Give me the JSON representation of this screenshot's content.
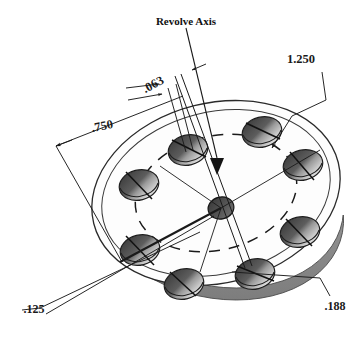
{
  "drawing": {
    "title": "Revolve Axis",
    "part_type": "revolved-disc-with-bolt-circle",
    "background_color": "#ffffff",
    "line_color": "#1a1a1a",
    "edge_band_color": "#8c8c8c",
    "hole_dark_color": "#4a4a4a",
    "hole_mid_color": "#6f6f6f",
    "hole_light_color": "#e8e8e8",
    "face_color": "#fdfdfd",
    "hole_count": 8,
    "annotations": {
      "axis_label": "Revolve Axis",
      "dimensions": [
        {
          "name": "outer-diameter",
          "value": "1.250",
          "x": 300,
          "y": 60
        },
        {
          "name": "hole-diameter",
          "value": ".063",
          "x": 155,
          "y": 88,
          "rotation": -30
        },
        {
          "name": "bolt-circle-offset",
          "value": ".750",
          "x": 100,
          "y": 128,
          "rotation": -12
        },
        {
          "name": "hub-diameter",
          "value": ".125",
          "x": 32,
          "y": 310
        },
        {
          "name": "thickness",
          "value": ".188",
          "x": 333,
          "y": 308
        }
      ]
    }
  }
}
